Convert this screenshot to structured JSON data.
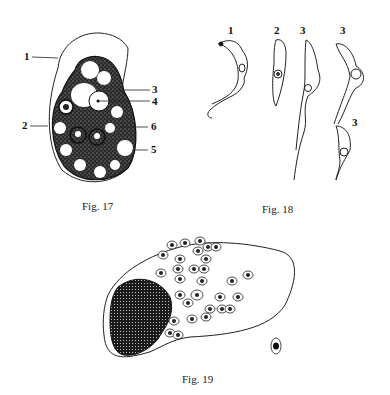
{
  "figures": [
    {
      "id": "fig17",
      "caption": "Fig. 17",
      "labels": [
        "1",
        "2",
        "3",
        "4",
        "5",
        "6"
      ]
    },
    {
      "id": "fig18",
      "caption": "Fig. 18",
      "labels": [
        "1",
        "2",
        "3",
        "3",
        "3"
      ]
    },
    {
      "id": "fig19",
      "caption": "Fig. 19"
    }
  ]
}
